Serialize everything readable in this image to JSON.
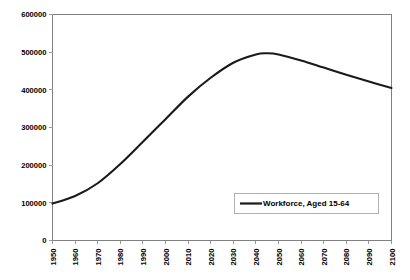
{
  "chart_data": {
    "type": "line",
    "title": "",
    "subtitle": "",
    "xlabel": "",
    "ylabel": "",
    "xlim": [
      1950,
      2100
    ],
    "ylim": [
      0,
      600000
    ],
    "grid": false,
    "legend_position": "inside-bottom-right",
    "y_ticks": [
      0,
      100000,
      200000,
      300000,
      400000,
      500000,
      600000
    ],
    "y_tick_labels": [
      "0",
      "100000",
      "200000",
      "300000",
      "400000",
      "500000",
      "600000"
    ],
    "x_ticks": [
      1950,
      1960,
      1970,
      1980,
      1990,
      2000,
      2010,
      2020,
      2030,
      2040,
      2050,
      2060,
      2070,
      2080,
      2090,
      2100
    ],
    "x_tick_labels": [
      "1950",
      "1960",
      "1970",
      "1980",
      "1990",
      "2000",
      "2010",
      "2020",
      "2030",
      "2040",
      "2050",
      "2060",
      "2070",
      "2080",
      "2090",
      "2100"
    ],
    "series": [
      {
        "name": "Workforce, Aged 15-64",
        "color": "#1a1a1a",
        "x": [
          1950,
          1960,
          1970,
          1980,
          1990,
          2000,
          2010,
          2020,
          2030,
          2040,
          2045,
          2050,
          2060,
          2070,
          2080,
          2090,
          2100
        ],
        "values": [
          98000,
          118000,
          152000,
          203000,
          262000,
          322000,
          382000,
          432000,
          472000,
          494000,
          497000,
          494000,
          478000,
          459000,
          440000,
          422000,
          405000
        ]
      }
    ],
    "annotations": []
  },
  "legend": {
    "entries": [
      {
        "label": "Workforce, Aged 15-64",
        "color": "#1a1a1a"
      }
    ]
  },
  "colors": {
    "background": "#ffffff",
    "axis": "#808080",
    "tick": "#9a9a9a",
    "series": "#1a1a1a",
    "legend_border": "#b0b0b0",
    "text": "#000000"
  }
}
